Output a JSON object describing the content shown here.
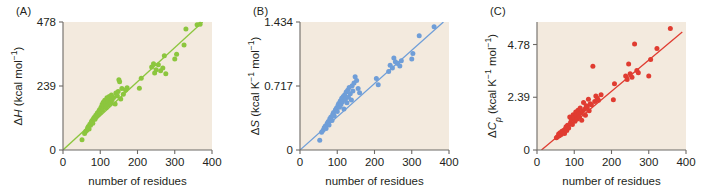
{
  "figure": {
    "background": "#ffffff",
    "plot_background": "#f3eade",
    "axis_color": "#6d6a66",
    "text_color": "#231f20"
  },
  "panels": [
    {
      "letter": "(A)",
      "color": "#8cc63e",
      "xlabel": "number of residues",
      "ylabel_parts": {
        "delta": "Δ",
        "symbol": "H",
        "units": "(kcal mol",
        "exp": "−1",
        "close": ")"
      },
      "ylabel_text": "ΔH (kcal mol−1)",
      "xticks": [
        "0",
        "100",
        "200",
        "300",
        "400"
      ],
      "yticks": [
        "0",
        "239",
        "478"
      ]
    },
    {
      "letter": "(B)",
      "color": "#6f9ed8",
      "xlabel": "number of residues",
      "ylabel_parts": {
        "delta": "Δ",
        "symbol": "S",
        "units": "(kcal K",
        "exp": "−1",
        "units2": " mol",
        "exp2": "−1",
        "close": ")"
      },
      "ylabel_text": "ΔS (kcal K−1 mol−1)",
      "xticks": [
        "0",
        "100",
        "200",
        "300",
        "400"
      ],
      "yticks": [
        "0",
        "0.717",
        "1.434"
      ]
    },
    {
      "letter": "(C)",
      "color": "#e03c31",
      "xlabel": "number of residues",
      "ylabel_parts": {
        "delta": "Δ",
        "symbol": "C",
        "sub": "p",
        "units": "(kcal K",
        "exp": "−1",
        "units2": " mol",
        "exp2": "−1",
        "close": ")"
      },
      "ylabel_text": "ΔCp (kcal K−1 mol−1)",
      "xticks": [
        "0",
        "100",
        "200",
        "300",
        "400"
      ],
      "yticks": [
        "0",
        "2.39",
        "4.78"
      ]
    }
  ],
  "chart_data": [
    {
      "type": "scatter",
      "panel": "(A)",
      "title": "",
      "xlabel": "number of residues",
      "ylabel": "ΔH (kcal mol−1)",
      "xlim": [
        0,
        400
      ],
      "ylim": [
        0,
        478
      ],
      "xticks": [
        0,
        100,
        200,
        300,
        400
      ],
      "yticks": [
        0,
        239,
        478
      ],
      "grid": false,
      "legend": null,
      "color": "#8cc63e",
      "fit_line": {
        "x": [
          0,
          375
        ],
        "y": [
          0,
          478
        ],
        "slope": 1.275,
        "intercept": 0
      },
      "x": [
        51,
        58,
        61,
        64,
        66,
        68,
        70,
        72,
        74,
        76,
        78,
        80,
        82,
        84,
        86,
        88,
        90,
        92,
        94,
        96,
        98,
        100,
        102,
        104,
        105,
        106,
        108,
        110,
        112,
        114,
        116,
        118,
        120,
        122,
        124,
        126,
        128,
        130,
        132,
        136,
        140,
        142,
        146,
        148,
        150,
        152,
        155,
        158,
        162,
        168,
        172,
        205,
        210,
        238,
        243,
        246,
        250,
        256,
        262,
        268,
        272,
        276,
        300,
        305,
        325,
        330,
        360,
        368
      ],
      "y": [
        38,
        62,
        70,
        74,
        82,
        88,
        78,
        96,
        92,
        105,
        110,
        100,
        118,
        122,
        115,
        130,
        126,
        138,
        132,
        145,
        150,
        140,
        160,
        155,
        170,
        148,
        178,
        165,
        186,
        172,
        158,
        195,
        182,
        168,
        200,
        190,
        176,
        205,
        188,
        196,
        172,
        213,
        202,
        218,
        262,
        255,
        190,
        230,
        208,
        224,
        232,
        231,
        268,
        310,
        322,
        288,
        300,
        318,
        296,
        306,
        352,
        285,
        340,
        358,
        392,
        452,
        468,
        470
      ]
    },
    {
      "type": "scatter",
      "panel": "(B)",
      "title": "",
      "xlabel": "number of residues",
      "ylabel": "ΔS (kcal K−1 mol−1)",
      "xlim": [
        0,
        400
      ],
      "ylim": [
        0,
        1.434
      ],
      "xticks": [
        0,
        100,
        200,
        300,
        400
      ],
      "yticks": [
        0,
        0.717,
        1.434
      ],
      "grid": false,
      "legend": null,
      "color": "#6f9ed8",
      "fit_line": {
        "x": [
          0,
          385
        ],
        "y": [
          0,
          1.434
        ],
        "slope": 0.003725,
        "intercept": 0
      },
      "x": [
        53,
        58,
        62,
        65,
        68,
        70,
        73,
        76,
        78,
        80,
        83,
        86,
        88,
        90,
        92,
        95,
        98,
        100,
        102,
        104,
        106,
        108,
        110,
        112,
        114,
        116,
        118,
        120,
        122,
        124,
        126,
        128,
        130,
        132,
        135,
        138,
        140,
        142,
        145,
        148,
        152,
        156,
        160,
        205,
        210,
        238,
        242,
        248,
        252,
        256,
        262,
        268,
        272,
        300,
        303,
        320,
        360
      ],
      "y": [
        0.11,
        0.2,
        0.22,
        0.25,
        0.27,
        0.24,
        0.3,
        0.32,
        0.28,
        0.35,
        0.37,
        0.33,
        0.4,
        0.42,
        0.38,
        0.45,
        0.47,
        0.43,
        0.5,
        0.52,
        0.48,
        0.55,
        0.51,
        0.58,
        0.54,
        0.6,
        0.46,
        0.62,
        0.57,
        0.65,
        0.53,
        0.67,
        0.59,
        0.7,
        0.63,
        0.56,
        0.72,
        0.66,
        0.75,
        0.82,
        0.78,
        0.69,
        0.64,
        0.8,
        0.73,
        0.88,
        0.95,
        0.92,
        1.03,
        0.99,
        0.97,
        0.94,
        1.0,
        1.02,
        1.08,
        1.28,
        1.38
      ]
    },
    {
      "type": "scatter",
      "panel": "(C)",
      "title": "",
      "xlabel": "number of residues",
      "ylabel": "ΔCp (kcal K−1 mol−1)",
      "xlim": [
        0,
        400
      ],
      "ylim": [
        0,
        5.8
      ],
      "xticks": [
        0,
        100,
        200,
        300,
        400
      ],
      "yticks": [
        0,
        2.39,
        4.78
      ],
      "grid": false,
      "legend": null,
      "color": "#e03c31",
      "fit_line": {
        "x": [
          12,
          390
        ],
        "y": [
          0,
          5.35
        ],
        "slope": 0.01416,
        "intercept": -0.17
      },
      "x": [
        52,
        55,
        58,
        60,
        62,
        65,
        67,
        70,
        72,
        74,
        76,
        78,
        80,
        82,
        85,
        88,
        90,
        92,
        95,
        97,
        100,
        102,
        104,
        106,
        108,
        110,
        112,
        114,
        116,
        118,
        120,
        122,
        125,
        128,
        130,
        132,
        135,
        138,
        140,
        143,
        146,
        150,
        155,
        158,
        162,
        165,
        172,
        205,
        208,
        238,
        242,
        246,
        250,
        255,
        262,
        268,
        272,
        300,
        305,
        322,
        358
      ],
      "y": [
        0.55,
        0.6,
        0.72,
        0.65,
        0.78,
        0.7,
        0.85,
        0.8,
        0.9,
        0.75,
        0.95,
        1.05,
        0.88,
        1.12,
        1.0,
        1.5,
        1.25,
        1.38,
        1.15,
        1.6,
        1.45,
        1.3,
        1.72,
        1.55,
        1.4,
        1.8,
        1.62,
        1.48,
        1.9,
        1.68,
        1.35,
        1.75,
        2.15,
        1.85,
        1.58,
        2.0,
        1.95,
        2.3,
        1.78,
        2.1,
        2.05,
        3.8,
        2.2,
        2.45,
        2.35,
        2.25,
        2.5,
        2.28,
        3.0,
        3.35,
        3.2,
        3.9,
        3.45,
        3.3,
        4.8,
        3.6,
        3.5,
        3.35,
        4.1,
        4.6,
        5.5
      ]
    }
  ]
}
